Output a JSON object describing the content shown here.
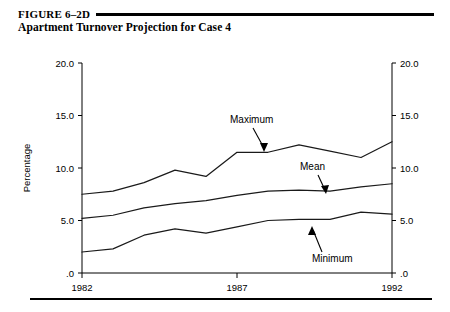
{
  "figure": {
    "number_label": "FIGURE 6–2D",
    "subtitle": "Apartment Turnover Projection for Case 4"
  },
  "chart_data": {
    "type": "line",
    "title": "Apartment Turnover Projection for Case 4",
    "xlabel": "",
    "ylabel": "Percentage",
    "x": [
      1982,
      1983,
      1984,
      1985,
      1986,
      1987,
      1988,
      1989,
      1990,
      1991,
      1992
    ],
    "xlim": [
      1982,
      1992
    ],
    "ylim": [
      0,
      20
    ],
    "xticks": [
      1982,
      1987,
      1992
    ],
    "xtick_labels": [
      "1982",
      "1987",
      "1992"
    ],
    "yticks": [
      0,
      5,
      10,
      15,
      20
    ],
    "ytick_labels": [
      ".0",
      "5.0",
      "10.0",
      "15.0",
      "20.0"
    ],
    "right_axis": true,
    "right_ytick_labels": [
      ".0",
      "5.0",
      "10.0",
      "15.0",
      "20.0"
    ],
    "grid": false,
    "legend": "none",
    "series": [
      {
        "name": "Maximum",
        "values": [
          7.5,
          7.8,
          8.6,
          9.8,
          9.2,
          11.5,
          11.5,
          12.2,
          11.6,
          11.0,
          12.5
        ]
      },
      {
        "name": "Mean",
        "values": [
          5.2,
          5.5,
          6.2,
          6.6,
          6.9,
          7.4,
          7.8,
          7.9,
          7.8,
          8.2,
          8.5
        ]
      },
      {
        "name": "Minimum",
        "values": [
          2.0,
          2.3,
          3.6,
          4.2,
          3.8,
          4.4,
          5.0,
          5.1,
          5.1,
          5.8,
          5.6
        ]
      }
    ],
    "annotations": [
      {
        "text": "Maximum",
        "points_to_series": "Maximum",
        "direction": "down"
      },
      {
        "text": "Mean",
        "points_to_series": "Mean",
        "direction": "down"
      },
      {
        "text": "Minimum",
        "points_to_series": "Minimum",
        "direction": "up"
      }
    ]
  }
}
